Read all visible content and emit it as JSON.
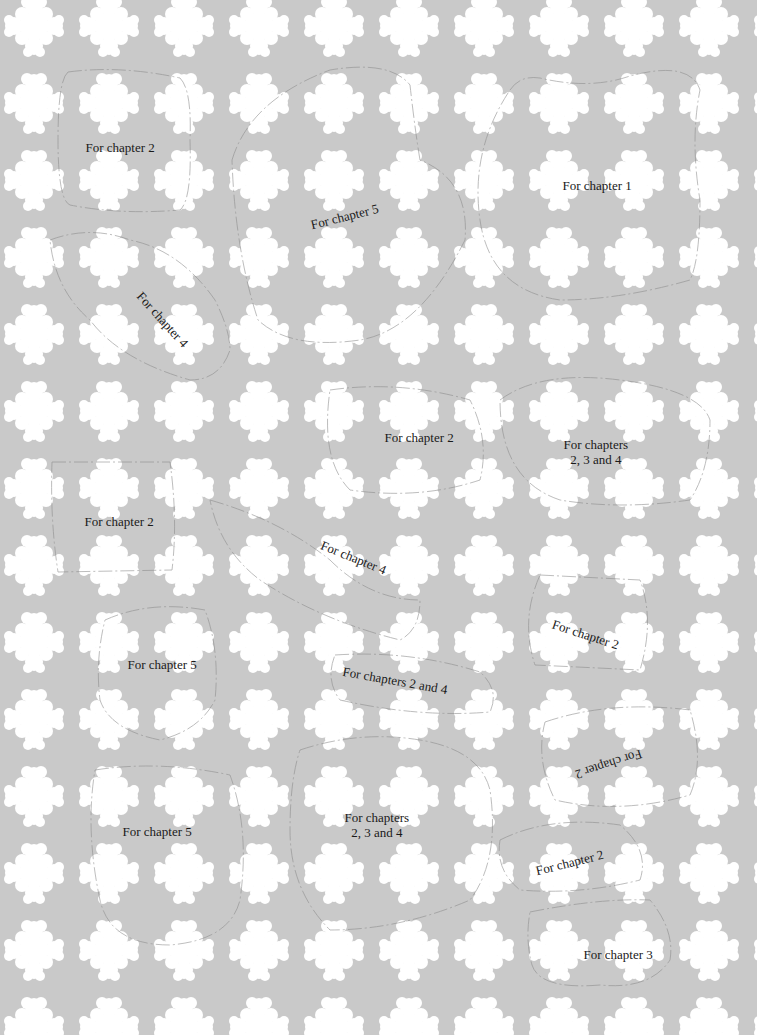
{
  "colors": {
    "background": "#c9c9c9",
    "motif": "#ffffff",
    "text": "#1a1a1a",
    "outline": "#8a8a8a"
  },
  "pattern": {
    "motif": "white quatrefoil/fleur motif",
    "spacing_x": 75,
    "spacing_y": 77
  },
  "labels": [
    {
      "text": "For chapter 2",
      "x": 120,
      "y": 147,
      "rotate": 0
    },
    {
      "text": "For chapter 5",
      "x": 344,
      "y": 216,
      "rotate": -14
    },
    {
      "text": "For chapter 1",
      "x": 597,
      "y": 185,
      "rotate": 0
    },
    {
      "text": "For chapter 4",
      "x": 162,
      "y": 319,
      "rotate": 48
    },
    {
      "text": "For chapter 2",
      "x": 419,
      "y": 437,
      "rotate": 0
    },
    {
      "text": "For chapters\n2, 3 and 4",
      "x": 596,
      "y": 452,
      "rotate": 0
    },
    {
      "text": "For chapter 2",
      "x": 119,
      "y": 521,
      "rotate": 0
    },
    {
      "text": "For chapter 4",
      "x": 353,
      "y": 557,
      "rotate": 22
    },
    {
      "text": "For chapter 2",
      "x": 585,
      "y": 634,
      "rotate": 18
    },
    {
      "text": "For chapter 5",
      "x": 162,
      "y": 664,
      "rotate": 0
    },
    {
      "text": "For chapters  2 and 4",
      "x": 395,
      "y": 680,
      "rotate": 10
    },
    {
      "text": "For chapter 2",
      "x": 608,
      "y": 764,
      "rotate": 162
    },
    {
      "text": "For chapter 5",
      "x": 157,
      "y": 831,
      "rotate": 0
    },
    {
      "text": "For chapters\n2, 3 and 4",
      "x": 377,
      "y": 825,
      "rotate": 0
    },
    {
      "text": "For chapter 2",
      "x": 569,
      "y": 862,
      "rotate": -14
    },
    {
      "text": "For chapter 3",
      "x": 618,
      "y": 954,
      "rotate": 0
    }
  ]
}
